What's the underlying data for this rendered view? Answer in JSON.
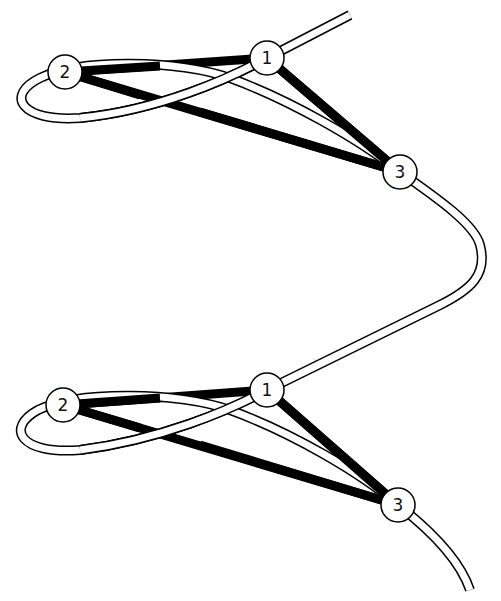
{
  "diagram": {
    "colors": {
      "edge": "#000000",
      "tube_outline": "#000000",
      "tube_fill": "#ffffff",
      "node_fill": "#ffffff",
      "background": "#ffffff"
    },
    "upper_triangle": {
      "nodes": [
        {
          "id": "1",
          "label": "1",
          "x": 267,
          "y": 58
        },
        {
          "id": "2",
          "label": "2",
          "x": 65,
          "y": 72
        },
        {
          "id": "3",
          "label": "3",
          "x": 400,
          "y": 172
        }
      ],
      "edges": [
        [
          "2",
          "1"
        ],
        [
          "2",
          "3"
        ],
        [
          "1",
          "3"
        ]
      ]
    },
    "lower_triangle": {
      "nodes": [
        {
          "id": "1",
          "label": "1",
          "x": 267,
          "y": 390
        },
        {
          "id": "2",
          "label": "2",
          "x": 63,
          "y": 405
        },
        {
          "id": "3",
          "label": "3",
          "x": 398,
          "y": 505
        }
      ],
      "edges": [
        [
          "2",
          "1"
        ],
        [
          "2",
          "3"
        ],
        [
          "1",
          "3"
        ]
      ]
    }
  }
}
